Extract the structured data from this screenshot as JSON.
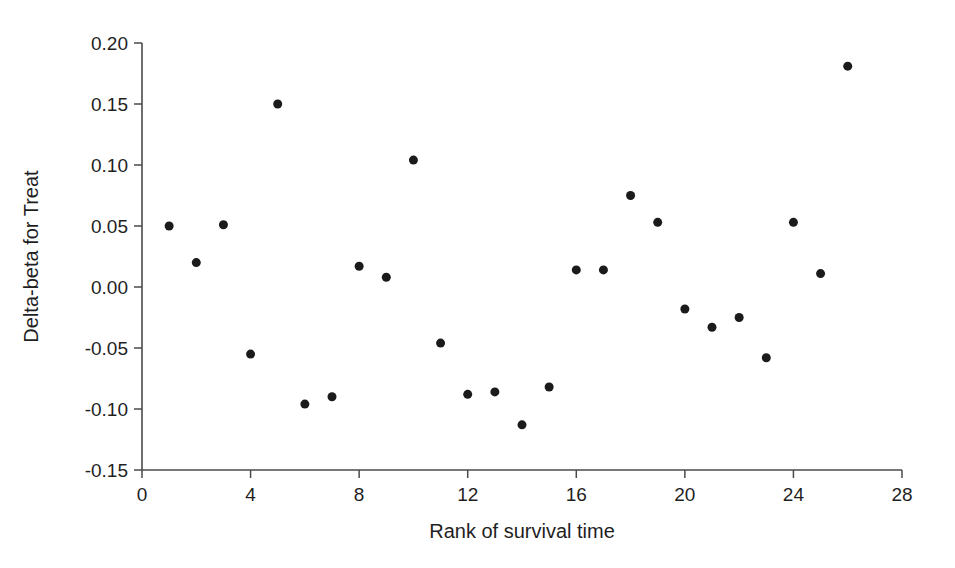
{
  "chart_data": {
    "type": "scatter",
    "title": "",
    "xlabel": "Rank of survival time",
    "ylabel": "Delta-beta for Treat",
    "xlim": [
      0,
      28
    ],
    "ylim": [
      -0.15,
      0.2
    ],
    "xticks": [
      0,
      4,
      8,
      12,
      16,
      20,
      24,
      28
    ],
    "xtick_labels": [
      "0",
      "4",
      "8",
      "12",
      "16",
      "20",
      "24",
      "28"
    ],
    "yticks": [
      0.2,
      0.15,
      0.1,
      0.05,
      0.0,
      -0.05,
      -0.1,
      -0.15
    ],
    "ytick_labels": [
      "0.20",
      "0.15",
      "0.10",
      "0.05",
      "0.00",
      "-0.05",
      "-0.10",
      "-0.15"
    ],
    "grid": false,
    "legend": "none",
    "marker": "filled-circle",
    "marker_color": "#1b1b1b",
    "marker_size_px": 9,
    "x": [
      1,
      2,
      3,
      4,
      5,
      6,
      7,
      8,
      9,
      10,
      11,
      12,
      13,
      14,
      15,
      16,
      17,
      18,
      19,
      20,
      21,
      22,
      23,
      24,
      25,
      26
    ],
    "y": [
      0.05,
      0.02,
      0.051,
      -0.055,
      0.15,
      -0.096,
      -0.09,
      0.017,
      0.008,
      0.104,
      -0.046,
      -0.088,
      -0.086,
      -0.113,
      -0.082,
      0.014,
      0.014,
      0.075,
      0.053,
      -0.018,
      -0.033,
      -0.025,
      -0.058,
      0.053,
      0.011,
      0.181
    ],
    "points": [
      {
        "x": 1,
        "y": 0.05
      },
      {
        "x": 2,
        "y": 0.02
      },
      {
        "x": 3,
        "y": 0.051
      },
      {
        "x": 4,
        "y": -0.055
      },
      {
        "x": 5,
        "y": 0.15
      },
      {
        "x": 6,
        "y": -0.096
      },
      {
        "x": 7,
        "y": -0.09
      },
      {
        "x": 8,
        "y": 0.017
      },
      {
        "x": 9,
        "y": 0.008
      },
      {
        "x": 10,
        "y": 0.104
      },
      {
        "x": 11,
        "y": -0.046
      },
      {
        "x": 12,
        "y": -0.088
      },
      {
        "x": 13,
        "y": -0.086
      },
      {
        "x": 14,
        "y": -0.113
      },
      {
        "x": 15,
        "y": -0.082
      },
      {
        "x": 16,
        "y": 0.014
      },
      {
        "x": 17,
        "y": 0.014
      },
      {
        "x": 18,
        "y": 0.075
      },
      {
        "x": 19,
        "y": 0.053
      },
      {
        "x": 20,
        "y": -0.018
      },
      {
        "x": 21,
        "y": -0.033
      },
      {
        "x": 22,
        "y": -0.025
      },
      {
        "x": 23,
        "y": -0.058
      },
      {
        "x": 24,
        "y": 0.053
      },
      {
        "x": 25,
        "y": 0.011
      },
      {
        "x": 26,
        "y": 0.181
      }
    ]
  },
  "figure": {
    "background_color": "#ffffff",
    "axis_color": "#4a4a4a",
    "text_color": "#1f1f1f"
  }
}
